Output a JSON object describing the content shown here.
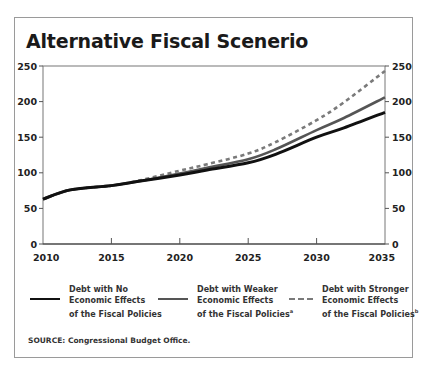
{
  "chart_data": {
    "type": "line",
    "title": "Alternative Fiscal Scenerio",
    "xlabel": "",
    "ylabel": "",
    "xlim": [
      2010,
      2035
    ],
    "ylim": [
      0,
      250
    ],
    "x_ticks": [
      2010,
      2015,
      2020,
      2025,
      2030,
      2035
    ],
    "y_ticks_left": [
      0,
      50,
      100,
      150,
      200,
      250
    ],
    "y_ticks_right": [
      0,
      50,
      100,
      150,
      200,
      250
    ],
    "grid": false,
    "legend_position": "bottom",
    "x": [
      2010,
      2012,
      2015,
      2017,
      2020,
      2022,
      2025,
      2027,
      2030,
      2032,
      2035
    ],
    "series": [
      {
        "name": "Debt with No Economic Effects of the Fiscal Policies",
        "style": "solid",
        "color": "#111111",
        "values": [
          63,
          76,
          82,
          88,
          97,
          104,
          114,
          126,
          150,
          163,
          185
        ]
      },
      {
        "name": "Debt with Weaker Economic Effects of the Fiscal Policies",
        "footnote": "a",
        "style": "solid",
        "color": "#555555",
        "values": [
          63,
          76,
          82,
          88,
          99,
          107,
          119,
          133,
          160,
          177,
          206
        ]
      },
      {
        "name": "Debt with Stronger Economic Effects of the Fiscal Policies",
        "footnote": "b",
        "style": "dashed",
        "color": "#7a7a7a",
        "values": [
          63,
          76,
          82,
          89,
          103,
          112,
          127,
          143,
          174,
          199,
          243
        ]
      }
    ]
  },
  "title": "Alternative Fiscal Scenerio",
  "legend": [
    {
      "label": "Debt with No\nEconomic Effects\nof the Fiscal Policies",
      "superscript": ""
    },
    {
      "label": "Debt with Weaker\nEconomic Effects\nof the Fiscal Policies",
      "superscript": "a"
    },
    {
      "label": "Debt with Stronger\nEconomic Effects\nof the Fiscal Policies",
      "superscript": "b"
    }
  ],
  "source": "SOURCE: Congressional Budget Office."
}
